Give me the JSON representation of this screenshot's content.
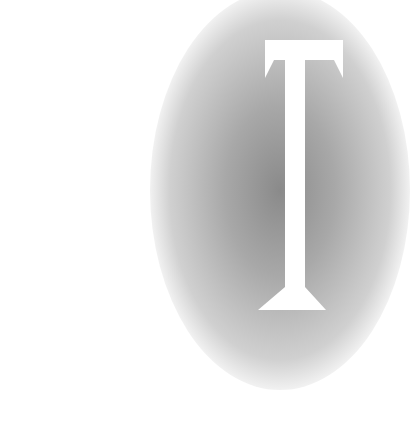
{
  "image": {
    "letter": "T",
    "letter_color": "#ffffff",
    "gradient_center_color": "#8a8a8a",
    "background_color": "#ffffff"
  }
}
